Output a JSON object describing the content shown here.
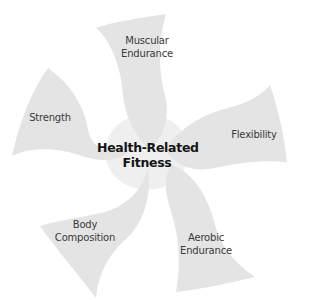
{
  "diagram": {
    "title_line1": "Health-Related",
    "title_line2": "Fitness",
    "components": [
      {
        "id": "muscular-endurance",
        "line1": "Muscular",
        "line2": "Endurance"
      },
      {
        "id": "flexibility",
        "line1": "Flexibility"
      },
      {
        "id": "aerobic-endurance",
        "line1": "Aerobic",
        "line2": "Endurance"
      },
      {
        "id": "body-composition",
        "line1": "Body",
        "line2": "Composition"
      },
      {
        "id": "strength",
        "line1": "Strength"
      }
    ],
    "colors": {
      "background": "#ffffff",
      "petal": "#e4e4e4",
      "text": "#3a3a3a",
      "title": "#151515"
    }
  }
}
